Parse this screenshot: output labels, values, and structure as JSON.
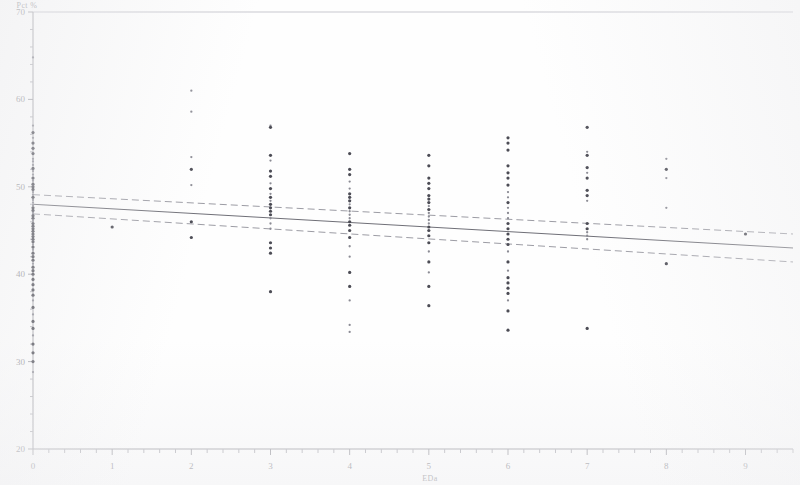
{
  "figure": {
    "background_color": "#fefefe",
    "ink_color": "#4c4c55",
    "axis_color": "#a0a0a6",
    "fit_color": "#6f6f77",
    "ci_color": "#9c9ca4"
  },
  "axes": {
    "y_title": "Pct %",
    "x_title": "EDa",
    "y_ticks": [
      70,
      60,
      50,
      40,
      30,
      20
    ],
    "x_ticks": [
      0,
      1,
      2,
      3,
      4,
      5,
      6,
      7,
      8,
      9
    ],
    "y_min": 20,
    "y_max": 70,
    "x_min": 0,
    "x_max": 9.6,
    "y_minor_step": 2,
    "x_minor_step": 0.2
  },
  "chart_data": {
    "type": "scatter",
    "title": "",
    "subtitle": "",
    "xlabel": "EDa",
    "ylabel": "Pct %",
    "xlim": [
      0,
      9.6
    ],
    "ylim": [
      20,
      70
    ],
    "grid": false,
    "legend": "none",
    "marker": "asterisk",
    "annotations": [],
    "series": [
      {
        "name": "observations",
        "type": "scatter",
        "points": [
          [
            0,
            64.8
          ],
          [
            0,
            57.0
          ],
          [
            0,
            56.2
          ],
          [
            0,
            55.6
          ],
          [
            0,
            55.0
          ],
          [
            0,
            54.4
          ],
          [
            0,
            53.8
          ],
          [
            0,
            53.2
          ],
          [
            0,
            52.9
          ],
          [
            0,
            52.5
          ],
          [
            0,
            52.1
          ],
          [
            0,
            51.8
          ],
          [
            0,
            51.4
          ],
          [
            0,
            51.0
          ],
          [
            0,
            50.7
          ],
          [
            0,
            50.3
          ],
          [
            0,
            50.0
          ],
          [
            0,
            49.7
          ],
          [
            0,
            49.4
          ],
          [
            0,
            49.1
          ],
          [
            0,
            48.8
          ],
          [
            0,
            48.5
          ],
          [
            0,
            48.2
          ],
          [
            0,
            47.9
          ],
          [
            0,
            47.6
          ],
          [
            0,
            47.3
          ],
          [
            0,
            47.0
          ],
          [
            0,
            46.7
          ],
          [
            0,
            46.4
          ],
          [
            0,
            46.1
          ],
          [
            0,
            45.8
          ],
          [
            0,
            45.5
          ],
          [
            0,
            45.2
          ],
          [
            0,
            44.9
          ],
          [
            0,
            44.6
          ],
          [
            0,
            44.3
          ],
          [
            0,
            44.0
          ],
          [
            0,
            43.7
          ],
          [
            0,
            43.4
          ],
          [
            0,
            43.1
          ],
          [
            0,
            42.8
          ],
          [
            0,
            42.4
          ],
          [
            0,
            42.0
          ],
          [
            0,
            41.6
          ],
          [
            0,
            41.2
          ],
          [
            0,
            40.8
          ],
          [
            0,
            40.4
          ],
          [
            0,
            40.0
          ],
          [
            0,
            39.4
          ],
          [
            0,
            38.8
          ],
          [
            0,
            38.2
          ],
          [
            0,
            37.6
          ],
          [
            0,
            37.0
          ],
          [
            0,
            36.2
          ],
          [
            0,
            35.4
          ],
          [
            0,
            34.6
          ],
          [
            0,
            33.8
          ],
          [
            0,
            33.0
          ],
          [
            0,
            32.0
          ],
          [
            0,
            31.0
          ],
          [
            0,
            30.0
          ],
          [
            0,
            28.8
          ],
          [
            1,
            45.4
          ],
          [
            2,
            61.0
          ],
          [
            2,
            58.6
          ],
          [
            2,
            53.4
          ],
          [
            2,
            52.0
          ],
          [
            2,
            50.2
          ],
          [
            2,
            46.0
          ],
          [
            2,
            44.2
          ],
          [
            3,
            57.0
          ],
          [
            3,
            56.8
          ],
          [
            3,
            53.6
          ],
          [
            3,
            53.0
          ],
          [
            3,
            51.8
          ],
          [
            3,
            51.2
          ],
          [
            3,
            50.4
          ],
          [
            3,
            49.8
          ],
          [
            3,
            49.2
          ],
          [
            3,
            48.8
          ],
          [
            3,
            48.4
          ],
          [
            3,
            48.0
          ],
          [
            3,
            47.6
          ],
          [
            3,
            47.2
          ],
          [
            3,
            46.8
          ],
          [
            3,
            46.4
          ],
          [
            3,
            45.8
          ],
          [
            3,
            45.2
          ],
          [
            3,
            43.6
          ],
          [
            3,
            43.0
          ],
          [
            3,
            42.4
          ],
          [
            3,
            38.0
          ],
          [
            4,
            53.8
          ],
          [
            4,
            52.0
          ],
          [
            4,
            51.4
          ],
          [
            4,
            50.6
          ],
          [
            4,
            49.8
          ],
          [
            4,
            49.2
          ],
          [
            4,
            48.8
          ],
          [
            4,
            48.4
          ],
          [
            4,
            48.0
          ],
          [
            4,
            47.6
          ],
          [
            4,
            47.2
          ],
          [
            4,
            46.8
          ],
          [
            4,
            46.4
          ],
          [
            4,
            46.0
          ],
          [
            4,
            45.6
          ],
          [
            4,
            45.0
          ],
          [
            4,
            44.2
          ],
          [
            4,
            43.2
          ],
          [
            4,
            42.0
          ],
          [
            4,
            40.2
          ],
          [
            4,
            38.6
          ],
          [
            4,
            37.0
          ],
          [
            4,
            34.2
          ],
          [
            4,
            33.4
          ],
          [
            5,
            53.6
          ],
          [
            5,
            52.4
          ],
          [
            5,
            51.0
          ],
          [
            5,
            50.4
          ],
          [
            5,
            49.8
          ],
          [
            5,
            49.0
          ],
          [
            5,
            48.6
          ],
          [
            5,
            48.2
          ],
          [
            5,
            47.8
          ],
          [
            5,
            47.4
          ],
          [
            5,
            47.0
          ],
          [
            5,
            46.6
          ],
          [
            5,
            46.2
          ],
          [
            5,
            45.8
          ],
          [
            5,
            45.4
          ],
          [
            5,
            45.0
          ],
          [
            5,
            44.4
          ],
          [
            5,
            43.6
          ],
          [
            5,
            42.6
          ],
          [
            5,
            41.4
          ],
          [
            5,
            40.2
          ],
          [
            5,
            38.6
          ],
          [
            5,
            36.4
          ],
          [
            6,
            55.6
          ],
          [
            6,
            55.0
          ],
          [
            6,
            54.2
          ],
          [
            6,
            52.4
          ],
          [
            6,
            51.6
          ],
          [
            6,
            51.0
          ],
          [
            6,
            50.2
          ],
          [
            6,
            49.4
          ],
          [
            6,
            48.8
          ],
          [
            6,
            48.2
          ],
          [
            6,
            47.6
          ],
          [
            6,
            47.0
          ],
          [
            6,
            46.4
          ],
          [
            6,
            45.8
          ],
          [
            6,
            45.2
          ],
          [
            6,
            44.6
          ],
          [
            6,
            44.0
          ],
          [
            6,
            43.4
          ],
          [
            6,
            42.6
          ],
          [
            6,
            41.4
          ],
          [
            6,
            40.4
          ],
          [
            6,
            39.6
          ],
          [
            6,
            39.0
          ],
          [
            6,
            38.4
          ],
          [
            6,
            37.8
          ],
          [
            6,
            37.0
          ],
          [
            6,
            35.8
          ],
          [
            6,
            33.6
          ],
          [
            7,
            56.8
          ],
          [
            7,
            54.0
          ],
          [
            7,
            53.6
          ],
          [
            7,
            52.2
          ],
          [
            7,
            51.6
          ],
          [
            7,
            51.0
          ],
          [
            7,
            49.6
          ],
          [
            7,
            49.0
          ],
          [
            7,
            48.4
          ],
          [
            7,
            45.8
          ],
          [
            7,
            45.2
          ],
          [
            7,
            44.8
          ],
          [
            7,
            44.4
          ],
          [
            7,
            44.0
          ],
          [
            7,
            33.8
          ],
          [
            8,
            53.2
          ],
          [
            8,
            52.0
          ],
          [
            8,
            51.0
          ],
          [
            8,
            47.6
          ],
          [
            8,
            41.2
          ],
          [
            9,
            44.6
          ]
        ]
      }
    ],
    "fit": {
      "name": "linear regression fit",
      "style": "solid",
      "x": [
        0,
        9.6
      ],
      "y": [
        48.0,
        43.0
      ],
      "slope": -0.52,
      "intercept": 48.0
    },
    "confidence_bands": {
      "name": "95% confidence interval",
      "style": "dashed",
      "upper": {
        "x": [
          0,
          9.6
        ],
        "y": [
          49.1,
          44.6
        ]
      },
      "lower": {
        "x": [
          0,
          9.6
        ],
        "y": [
          46.9,
          41.4
        ]
      }
    }
  }
}
